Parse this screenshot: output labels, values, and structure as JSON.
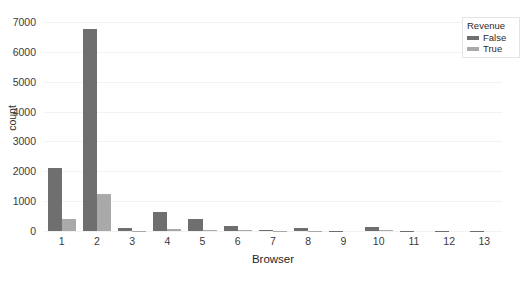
{
  "chart_data": {
    "type": "bar",
    "title": "",
    "xlabel": "Browser",
    "ylabel": "count",
    "categories": [
      "1",
      "2",
      "3",
      "4",
      "5",
      "6",
      "7",
      "8",
      "9",
      "10",
      "11",
      "12",
      "13"
    ],
    "series": [
      {
        "name": "False",
        "color": "#6f6f6f",
        "values": [
          2120,
          6760,
          100,
          650,
          400,
          155,
          35,
          115,
          8,
          145,
          10,
          6,
          6
        ]
      },
      {
        "name": "True",
        "color": "#a9a9a9",
        "values": [
          400,
          1250,
          15,
          80,
          50,
          20,
          4,
          12,
          1,
          18,
          1,
          0,
          0
        ]
      }
    ],
    "ylim": [
      0,
      7000
    ],
    "yticks": [
      0,
      1000,
      2000,
      3000,
      4000,
      5000,
      6000,
      7000
    ],
    "ytick_labels": [
      "0",
      "1000",
      "2000",
      "3000",
      "4000",
      "5000",
      "6000",
      "7000"
    ],
    "grid": true,
    "grid_axis": "y",
    "legend": {
      "title": "Revenue",
      "position": "top-right",
      "entries": [
        {
          "label": "False",
          "color": "#6f6f6f"
        },
        {
          "label": "True",
          "color": "#a9a9a9"
        }
      ]
    },
    "style": "whitegrid",
    "background": "#ffffff"
  }
}
